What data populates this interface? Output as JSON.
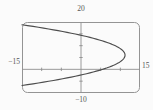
{
  "chart_data": {
    "type": "line",
    "title": "",
    "equation": "x = 11.2 - (y - 6)^2 / 6.3",
    "xlim": [
      -15,
      15
    ],
    "ylim": [
      -10,
      20
    ],
    "xticks": [
      -10,
      -5,
      5,
      10
    ],
    "yticks": [
      -5,
      5,
      10,
      15
    ],
    "tick_step": 5,
    "grid": false,
    "legend": false,
    "window_labels": {
      "top": "20",
      "bottom": "−10",
      "left": "−15",
      "right": "15"
    },
    "parabola": {
      "vertex_x": 11.2,
      "vertex_y": 6,
      "coeff": -0.159,
      "y_range": [
        -6.84,
        18.84
      ]
    },
    "points": [
      [
        -15.0,
        18.84
      ],
      [
        -8.0,
        17.0
      ],
      [
        -1.7,
        15.0
      ],
      [
        3.4,
        13.0
      ],
      [
        7.2,
        11.0
      ],
      [
        9.8,
        9.0
      ],
      [
        11.0,
        7.0
      ],
      [
        11.2,
        6.0
      ],
      [
        11.0,
        5.0
      ],
      [
        9.8,
        3.0
      ],
      [
        7.2,
        1.0
      ],
      [
        3.4,
        -1.0
      ],
      [
        -1.7,
        -3.0
      ],
      [
        -8.0,
        -5.0
      ],
      [
        -15.0,
        -6.84
      ]
    ],
    "colors": {
      "curve": "#4d4d4d",
      "axes": "#8f8f8f",
      "frame": "#949494",
      "label": "#565656",
      "background": "#fbfbfb"
    },
    "plot_area_px": {
      "left": 22,
      "top": 22,
      "width": 118,
      "height": 71
    }
  }
}
